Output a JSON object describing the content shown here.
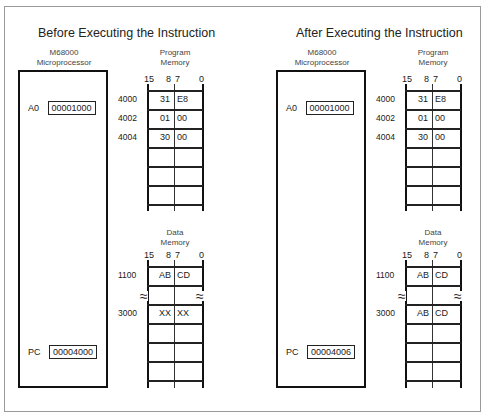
{
  "panels": [
    {
      "title": "Before Executing the Instruction",
      "cpu_label": [
        "M68000",
        "Microprocessor"
      ],
      "registers": {
        "a0_label": "A0",
        "a0_value": "00001000",
        "pc_label": "PC",
        "pc_value": "00004000"
      },
      "program_memory": {
        "label": [
          "Program",
          "Memory"
        ],
        "bits": [
          "15",
          "8",
          "7",
          "0"
        ],
        "rows": [
          {
            "address": "4000",
            "high": "31",
            "low": "E8"
          },
          {
            "address": "4002",
            "high": "01",
            "low": "00"
          },
          {
            "address": "4004",
            "high": "30",
            "low": "00"
          }
        ]
      },
      "data_memory": {
        "label": [
          "Data",
          "Memory"
        ],
        "bits": [
          "15",
          "8",
          "7",
          "0"
        ],
        "rows": [
          {
            "address": "1100",
            "high": "AB",
            "low": "CD"
          },
          {
            "address": "3000",
            "high": "XX",
            "low": "XX"
          }
        ]
      }
    },
    {
      "title": "After Executing the Instruction",
      "cpu_label": [
        "M68000",
        "Microprocessor"
      ],
      "registers": {
        "a0_label": "A0",
        "a0_value": "00001000",
        "pc_label": "PC",
        "pc_value": "00004006"
      },
      "program_memory": {
        "label": [
          "Program",
          "Memory"
        ],
        "bits": [
          "15",
          "8",
          "7",
          "0"
        ],
        "rows": [
          {
            "address": "4000",
            "high": "31",
            "low": "E8"
          },
          {
            "address": "4002",
            "high": "01",
            "low": "00"
          },
          {
            "address": "4004",
            "high": "30",
            "low": "00"
          }
        ]
      },
      "data_memory": {
        "label": [
          "Data",
          "Memory"
        ],
        "bits": [
          "15",
          "8",
          "7",
          "0"
        ],
        "rows": [
          {
            "address": "1100",
            "high": "AB",
            "low": "CD"
          },
          {
            "address": "3000",
            "high": "AB",
            "low": "CD"
          }
        ]
      }
    }
  ],
  "symbols": {
    "break_mark": "≈"
  }
}
